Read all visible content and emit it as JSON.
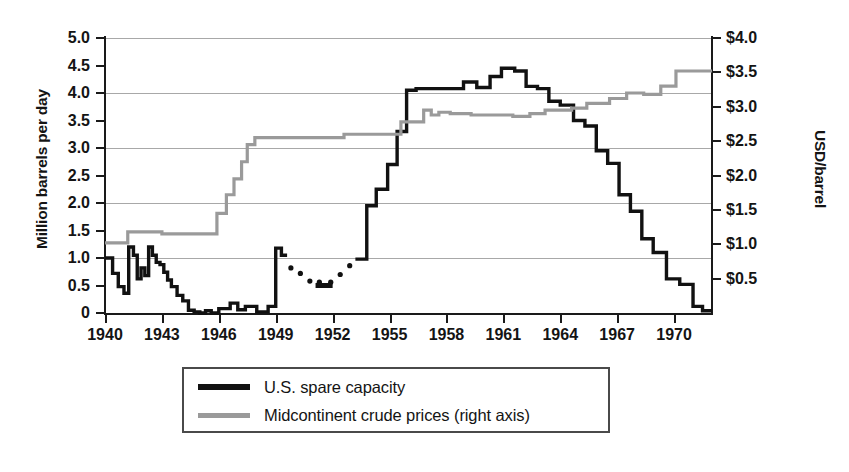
{
  "chart_data": {
    "type": "line",
    "title": "",
    "xlabel": "",
    "ylabel": "Million barrels per day",
    "ylabel_right": "USD/barrel",
    "xlim": [
      1940,
      1972
    ],
    "ylim": [
      0,
      5.0
    ],
    "ylim_right": [
      0,
      4.0
    ],
    "grid": true,
    "grid_values": [
      1.0,
      2.0,
      3.0,
      4.0,
      5.0
    ],
    "legend_position": "bottom-center",
    "yticks": [
      "5.0",
      "4.5",
      "4.0",
      "3.5",
      "3.0",
      "2.5",
      "2.0",
      "1.5",
      "1.0",
      "0.5",
      "0"
    ],
    "ytick_values": [
      5.0,
      4.5,
      4.0,
      3.5,
      3.0,
      2.5,
      2.0,
      1.5,
      1.0,
      0.5,
      0
    ],
    "yticks_right": [
      "$4.0",
      "$3.5",
      "$3.0",
      "$2.5",
      "$2.0",
      "$1.5",
      "$1.0",
      "$0.5"
    ],
    "ytick_right_values": [
      4.0,
      3.5,
      3.0,
      2.5,
      2.0,
      1.5,
      1.0,
      0.5
    ],
    "xticks": [
      "1940",
      "1943",
      "1946",
      "1949",
      "1952",
      "1955",
      "1958",
      "1961",
      "1964",
      "1967",
      "1970"
    ],
    "xtick_values": [
      1940,
      1943,
      1946,
      1949,
      1952,
      1955,
      1958,
      1961,
      1964,
      1967,
      1970
    ],
    "series": [
      {
        "name": "U.S. spare capacity",
        "axis": "left",
        "color": "#111111",
        "style": "solid",
        "x": [
          1940.0,
          1940.4,
          1940.4,
          1940.7,
          1940.7,
          1941.0,
          1941.0,
          1941.25,
          1941.25,
          1941.5,
          1941.5,
          1941.7,
          1941.7,
          1941.9,
          1941.9,
          1942.1,
          1942.1,
          1942.3,
          1942.3,
          1942.5,
          1942.5,
          1942.7,
          1942.7,
          1942.9,
          1942.9,
          1943.1,
          1943.1,
          1943.3,
          1943.3,
          1943.5,
          1943.5,
          1943.8,
          1943.8,
          1944.1,
          1944.1,
          1944.4,
          1944.4,
          1944.7,
          1944.7,
          1945.0,
          1945.0,
          1945.3,
          1945.3,
          1945.6,
          1945.6,
          1946.0,
          1946.0,
          1946.6,
          1946.6,
          1947.0,
          1947.0,
          1947.4,
          1947.4,
          1948.0,
          1948.0,
          1948.6,
          1948.6,
          1949.0,
          1949.0,
          1949.3,
          1949.3,
          1949.6
        ],
        "y": [
          1.0,
          1.0,
          0.72,
          0.72,
          0.48,
          0.48,
          0.36,
          0.36,
          1.2,
          1.2,
          1.05,
          1.05,
          0.62,
          0.62,
          0.82,
          0.82,
          0.68,
          0.68,
          1.2,
          1.2,
          1.05,
          1.05,
          0.92,
          0.92,
          0.88,
          0.88,
          0.74,
          0.74,
          0.6,
          0.6,
          0.48,
          0.48,
          0.32,
          0.32,
          0.22,
          0.22,
          0.05,
          0.05,
          0.02,
          0.02,
          0.0,
          0.0,
          0.04,
          0.04,
          0.0,
          0.0,
          0.08,
          0.08,
          0.18,
          0.18,
          0.06,
          0.06,
          0.12,
          0.12,
          0.02,
          0.02,
          0.12,
          0.12,
          1.18,
          1.18,
          1.05,
          1.05
        ],
        "comment_values": "early 1940s oscillation 0.3-1.2, collapse to ~0 through WWII 1944-1948, brief spike to 1.2 in 1949"
      },
      {
        "name": "U.S. spare capacity (interpolated)",
        "axis": "left",
        "color": "#111111",
        "style": "dotted",
        "x": [
          1949.8,
          1950.3,
          1950.8,
          1951.3,
          1951.9,
          1952.4,
          1952.9
        ],
        "y": [
          0.82,
          0.72,
          0.58,
          0.56,
          0.56,
          0.7,
          0.86
        ],
        "comment_values": "dotted/estimated interval 1950-1953, dips to about 0.55"
      },
      {
        "name": "U.S. spare capacity (cont.)",
        "axis": "left",
        "color": "#111111",
        "style": "solid",
        "x": [
          1953.2,
          1953.8,
          1953.8,
          1954.3,
          1954.3,
          1954.9,
          1954.9,
          1955.4,
          1955.4,
          1955.9,
          1955.9,
          1956.4,
          1956.4,
          1958.9,
          1958.9,
          1959.6,
          1959.6,
          1960.3,
          1960.3,
          1960.9,
          1960.9,
          1961.6,
          1961.6,
          1962.2,
          1962.2,
          1962.8,
          1962.8,
          1963.4,
          1963.4,
          1964.0,
          1964.0,
          1964.7,
          1964.7,
          1965.3,
          1965.3,
          1965.9,
          1965.9,
          1966.5,
          1966.5,
          1967.1,
          1967.1,
          1967.7,
          1967.7,
          1968.3,
          1968.3,
          1968.9,
          1968.9,
          1969.6,
          1969.6,
          1970.3,
          1970.3,
          1971.0,
          1971.0,
          1971.5,
          1971.5,
          1972.0
        ],
        "y": [
          0.98,
          0.98,
          1.95,
          1.95,
          2.25,
          2.25,
          2.7,
          2.7,
          3.3,
          3.3,
          4.05,
          4.05,
          4.08,
          4.08,
          4.2,
          4.2,
          4.1,
          4.1,
          4.3,
          4.3,
          4.45,
          4.45,
          4.4,
          4.4,
          4.12,
          4.12,
          4.08,
          4.08,
          3.85,
          3.85,
          3.78,
          3.78,
          3.5,
          3.5,
          3.4,
          3.4,
          2.95,
          2.95,
          2.72,
          2.72,
          2.15,
          2.15,
          1.85,
          1.85,
          1.35,
          1.35,
          1.1,
          1.1,
          0.62,
          0.62,
          0.52,
          0.52,
          0.12,
          0.12,
          0.04,
          0.04
        ],
        "comment_values": "steep rise 1953-1956 to ~4.05, plateau with peak 4.45 in 1961-62, decline to ~0 by 1972"
      },
      {
        "name": "Midcontinent crude prices (right axis)",
        "axis": "right",
        "color": "#9a9a9a",
        "style": "solid",
        "x": [
          1940.0,
          1941.2,
          1941.2,
          1943.0,
          1943.0,
          1945.9,
          1945.9,
          1946.4,
          1946.4,
          1946.8,
          1946.8,
          1947.2,
          1947.2,
          1947.5,
          1947.5,
          1947.9,
          1947.9,
          1952.6,
          1952.6,
          1955.6,
          1955.6,
          1956.8,
          1956.8,
          1957.2,
          1957.2,
          1957.6,
          1957.6,
          1958.2,
          1958.2,
          1959.3,
          1959.3,
          1961.5,
          1961.5,
          1962.4,
          1962.4,
          1963.2,
          1963.2,
          1964.6,
          1964.6,
          1965.4,
          1965.4,
          1966.6,
          1966.6,
          1967.5,
          1967.5,
          1968.4,
          1968.4,
          1969.3,
          1969.3,
          1970.1,
          1970.1,
          1972.0
        ],
        "y": [
          1.02,
          1.02,
          1.18,
          1.18,
          1.15,
          1.15,
          1.45,
          1.45,
          1.72,
          1.72,
          1.95,
          1.95,
          2.2,
          2.2,
          2.45,
          2.45,
          2.55,
          2.55,
          2.6,
          2.6,
          2.78,
          2.78,
          2.95,
          2.95,
          2.88,
          2.88,
          2.92,
          2.92,
          2.9,
          2.9,
          2.88,
          2.88,
          2.86,
          2.86,
          2.9,
          2.9,
          2.95,
          2.95,
          2.98,
          2.98,
          3.05,
          3.05,
          3.12,
          3.12,
          3.2,
          3.2,
          3.18,
          3.18,
          3.3,
          3.3,
          3.52,
          3.52
        ],
        "comment_values": "step function from about $1.00 in 1940, jumps through late 1940s to $2.55, flat near $2.9-3.0 through 1960s, ends at $3.5"
      }
    ]
  },
  "axes": {
    "left_title": "Million barrels per day",
    "right_title": "USD/barrel"
  },
  "legend": {
    "items": [
      {
        "label": "U.S. spare capacity",
        "swatch": "dark"
      },
      {
        "label": "Midcontinent crude prices (right axis)",
        "swatch": "gray"
      }
    ]
  }
}
